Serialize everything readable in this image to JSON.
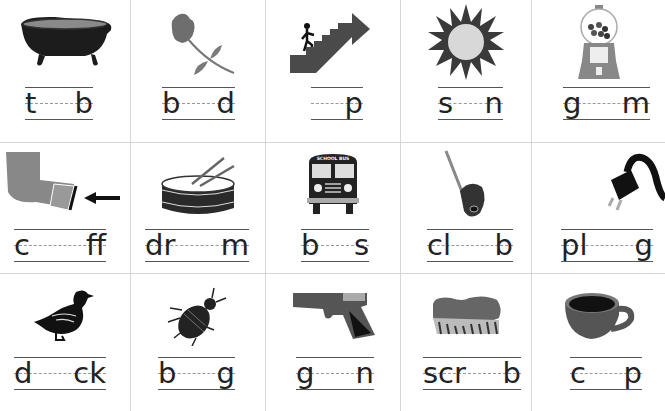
{
  "worksheet": {
    "rows": [
      {
        "cells": [
          {
            "picture": "bathtub",
            "parts": [
              "t",
              "b"
            ],
            "answer": "tub"
          },
          {
            "picture": "rose",
            "parts": [
              "b",
              "d"
            ],
            "answer": "bud"
          },
          {
            "picture": "stairs-up-arrow",
            "parts": [
              "",
              "p"
            ],
            "answer": "up"
          },
          {
            "picture": "sun",
            "parts": [
              "s",
              "n"
            ],
            "answer": "sun"
          },
          {
            "picture": "gumball-machine",
            "parts": [
              "g",
              "m"
            ],
            "answer": "gum"
          }
        ]
      },
      {
        "cells": [
          {
            "picture": "shirt-cuff-arrow",
            "parts": [
              "c",
              "ff"
            ],
            "answer": "cuff"
          },
          {
            "picture": "drum",
            "parts": [
              "dr",
              "m"
            ],
            "answer": "drum"
          },
          {
            "picture": "school-bus",
            "parts": [
              "b",
              "s"
            ],
            "answer": "bus",
            "picture_text": "SCHOOL BUS"
          },
          {
            "picture": "golf-club",
            "parts": [
              "cl",
              "b"
            ],
            "answer": "club"
          },
          {
            "picture": "electric-plug",
            "parts": [
              "pl",
              "g"
            ],
            "answer": "plug"
          }
        ]
      },
      {
        "cells": [
          {
            "picture": "duck",
            "parts": [
              "d",
              "ck"
            ],
            "answer": "duck"
          },
          {
            "picture": "bug",
            "parts": [
              "b",
              "g"
            ],
            "answer": "bug"
          },
          {
            "picture": "gun",
            "parts": [
              "g",
              "n"
            ],
            "answer": "gun"
          },
          {
            "picture": "scrub-brush",
            "parts": [
              "scr",
              "b"
            ],
            "answer": "scrub"
          },
          {
            "picture": "cup",
            "parts": [
              "c",
              "p"
            ],
            "answer": "cup"
          }
        ]
      }
    ],
    "colors": {
      "grid": "#d6d6d6",
      "ink": "#222222",
      "guide_dash": "#999999"
    }
  }
}
